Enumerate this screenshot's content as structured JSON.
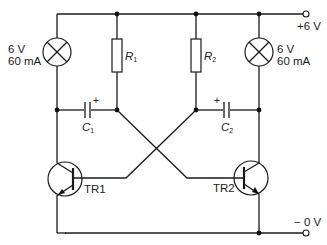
{
  "diagram": {
    "supply": {
      "positive": "+6 V",
      "negative": "− 0 V"
    },
    "lamps": [
      {
        "id": "lamp-left",
        "voltage": "6 V",
        "current": "60 mA"
      },
      {
        "id": "lamp-right",
        "voltage": "6 V",
        "current": "60 mA"
      }
    ],
    "resistors": [
      {
        "id": "R1",
        "letter": "R",
        "sub": "1"
      },
      {
        "id": "R2",
        "letter": "R",
        "sub": "2"
      }
    ],
    "capacitors": [
      {
        "id": "C1",
        "letter": "C",
        "sub": "1",
        "polarity": "+"
      },
      {
        "id": "C2",
        "letter": "C",
        "sub": "2",
        "polarity": "+"
      }
    ],
    "transistors": [
      {
        "id": "TR1",
        "label": "TR1"
      },
      {
        "id": "TR2",
        "label": "TR2"
      }
    ],
    "colors": {
      "line": "#1a1a1a",
      "background": "#ffffff"
    }
  }
}
